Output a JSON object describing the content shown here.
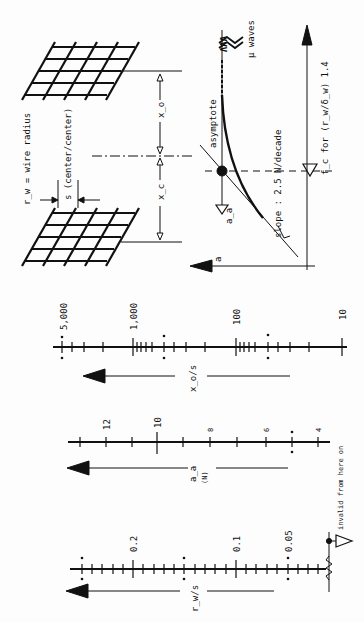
{
  "figure": {
    "colors": {
      "ink": "#111111",
      "paper": "#fdfdfd"
    },
    "top_diagram": {
      "wire_radius_label": "r_w = wire radius",
      "spacing_label": "s (center/center)",
      "x_o_label": "x_o",
      "x_c_label": "x_c",
      "asymptote_label": "asymptote",
      "slope_label": "slope : 2.5 N/decade",
      "freq_label": "f_c for (r_w/δ_w) 1.4",
      "waves_label": "μ waves",
      "a_axis_label": "a",
      "a_a_label": "a_a"
    },
    "scales": [
      {
        "name": "x_o/s",
        "label": "x_o/s",
        "type": "log",
        "tick_labels": [
          "5,000",
          "1,000",
          "100",
          "10"
        ]
      },
      {
        "name": "a_a (N)",
        "label": "a_a",
        "sublabel": "(N)",
        "type": "linear",
        "tick_labels": [
          "12",
          "10",
          "8",
          "6",
          "4"
        ]
      },
      {
        "name": "r_w/s",
        "label": "r_w/s",
        "type": "linear",
        "tick_labels": [
          "0.2",
          "0.1",
          "0.05"
        ],
        "annotation": "invalid from here on"
      }
    ]
  }
}
